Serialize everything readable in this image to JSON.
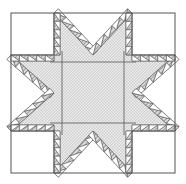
{
  "diagram": {
    "title": "",
    "type": "quilt-block-star",
    "width": 186,
    "height": 184,
    "colors": {
      "background": "#ffffff",
      "line": "#555555",
      "hatch_light": "#eeeeee",
      "hatch_dark": "#c8c8c8",
      "sawtooth_dark": "#8a8a8a",
      "white_patch": "#ffffff"
    },
    "outer": {
      "x0": 11,
      "y0": 13,
      "x1": 175,
      "y1": 173
    },
    "grid": {
      "cols": [
        11,
        54,
        132,
        175
      ],
      "rows": [
        13,
        55,
        131,
        173
      ]
    },
    "center_inner": {
      "x0": 62,
      "y0": 62,
      "x1": 124,
      "y1": 123
    },
    "sawtooth_teeth_per_edge": 5,
    "components": [
      {
        "name": "corner-square-top-left",
        "fill": "white"
      },
      {
        "name": "corner-square-top-right",
        "fill": "white"
      },
      {
        "name": "corner-square-bottom-left",
        "fill": "white"
      },
      {
        "name": "corner-square-bottom-right",
        "fill": "white"
      },
      {
        "name": "center-square",
        "fill": "hatched"
      },
      {
        "name": "star-point-top",
        "fill": "hatched"
      },
      {
        "name": "star-point-right",
        "fill": "hatched"
      },
      {
        "name": "star-point-bottom",
        "fill": "hatched"
      },
      {
        "name": "star-point-left",
        "fill": "hatched"
      }
    ]
  }
}
